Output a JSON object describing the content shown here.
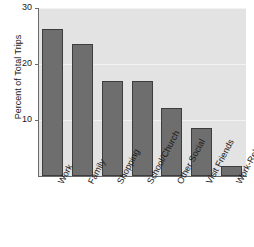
{
  "chart_data": {
    "type": "bar",
    "title": "",
    "subtitle": "",
    "xlabel": "",
    "ylabel": "Percent of Total Trips",
    "categories": [
      "Work",
      "Family",
      "Shopping",
      "School/Church",
      "Other Social",
      "Visit Friends",
      "Work-Related"
    ],
    "values": [
      26.2,
      23.5,
      17.0,
      17.0,
      12.2,
      8.5,
      1.7
    ],
    "series": [
      {
        "name": "Percent of Total Trips",
        "values": [
          26.2,
          23.5,
          17.0,
          17.0,
          12.2,
          8.5,
          1.7
        ]
      }
    ],
    "ylim": [
      0,
      30
    ],
    "xlim_categories": 7,
    "y_ticks": [
      10,
      20,
      30
    ],
    "y_tick_labels": [
      "10",
      "20",
      "30"
    ],
    "grid": true,
    "grid_axis": "y",
    "legend": false,
    "legend_position": "none",
    "bar_color": "#6e6e6e",
    "bar_edge_color": "#3d3d3d",
    "plot_background_color": "#e3e3e3",
    "gridline_color": "#f2f2f2",
    "axis_color": "#6a6a6a",
    "text_color": "#1a1a1a",
    "x_tick_label_rotation": -62
  }
}
